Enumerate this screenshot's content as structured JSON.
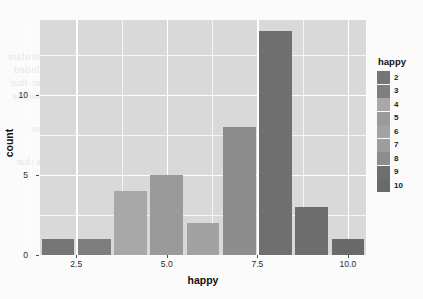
{
  "chart_data": {
    "type": "bar",
    "title": "",
    "xlabel": "happy",
    "ylabel": "count",
    "categories": [
      2,
      3,
      4,
      5,
      6,
      7,
      8,
      9,
      10
    ],
    "values": [
      1,
      1,
      4,
      5,
      2,
      8,
      14,
      3,
      1
    ],
    "bar_colors": [
      "#757575",
      "#7e7e7e",
      "#a8a8a8",
      "#9a9a9a",
      "#a2a2a2",
      "#8d8d8d",
      "#6f6f6f",
      "#6d6d6d",
      "#6a6a6a"
    ],
    "xlim": [
      1.5,
      10.5
    ],
    "ylim": [
      0,
      14.7
    ],
    "x_ticks": [
      "2.5",
      "5.0",
      "7.5",
      "10.0"
    ],
    "x_tick_values": [
      2.5,
      5.0,
      7.5,
      10.0
    ],
    "y_ticks": [
      "0",
      "5",
      "10"
    ],
    "y_tick_values": [
      0,
      5,
      10
    ],
    "y_minor_values": [
      2.5,
      7.5,
      12.5
    ],
    "x_minor_values": [
      1.25,
      3.75,
      6.25,
      8.75
    ],
    "grid": true,
    "panel_background": "#d9d9d9",
    "grid_color": "#ffffff",
    "legend": {
      "title": "happy",
      "position": "right",
      "entries": [
        {
          "label": "2",
          "color": "#757575"
        },
        {
          "label": "3",
          "color": "#7e7e7e"
        },
        {
          "label": "4",
          "color": "#a8a8a8"
        },
        {
          "label": "5",
          "color": "#9a9a9a"
        },
        {
          "label": "6",
          "color": "#a2a2a2"
        },
        {
          "label": "7",
          "color": "#9d9d9d"
        },
        {
          "label": "8",
          "color": "#8d8d8d"
        },
        {
          "label": "9",
          "color": "#6f6f6f"
        },
        {
          "label": "10",
          "color": "#6a6a6a"
        }
      ]
    }
  },
  "background_bleed": [
    {
      "text": "happy",
      "x": 186,
      "y": 31,
      "size": 11
    },
    {
      "text": "produces a scale. the chart does not a recapitulate",
      "x": 8,
      "y": 50,
      "size": 11
    },
    {
      "text": "the comparative value is amount to a section of included",
      "x": 14,
      "y": 63,
      "size": 11
    },
    {
      "text": "cases - a more anes we can conclude from the mean that",
      "x": 10,
      "y": 76,
      "size": 11
    },
    {
      "text": "the next of an it the scale numbers and that the the",
      "x": 12,
      "y": 89,
      "size": 11
    },
    {
      "text": "mumurmu of observed from eachdistribution",
      "x": 42,
      "y": 102,
      "size": 11
    },
    {
      "text": "counting of happiness and the the housenmost",
      "x": 30,
      "y": 122,
      "size": 11
    },
    {
      "text": "than it their cases as the are a simple",
      "x": 56,
      "y": 135,
      "size": 11
    },
    {
      "text": "numbers is a variable and the count as that",
      "x": 16,
      "y": 155,
      "size": 11
    },
    {
      "text": "happy",
      "x": 158,
      "y": 172,
      "size": 11
    }
  ]
}
